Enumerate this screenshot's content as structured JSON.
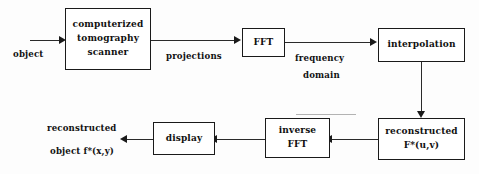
{
  "diagram": {
    "background_color": "#fdfdfd",
    "line_color": "#1a1a1a",
    "text_color": "#111111",
    "nodes": [
      {
        "id": "scanner",
        "lines": [
          "computerized",
          "tomography",
          "scanner"
        ]
      },
      {
        "id": "fft",
        "lines": [
          "FFT"
        ]
      },
      {
        "id": "interpolation",
        "lines": [
          "interpolation"
        ]
      },
      {
        "id": "reconstructed",
        "lines": [
          "reconstructed",
          "F*(u,v)"
        ]
      },
      {
        "id": "inverse_fft",
        "lines": [
          "inverse",
          "FFT"
        ]
      },
      {
        "id": "display",
        "lines": [
          "display"
        ]
      }
    ],
    "edge_labels": {
      "input": "object",
      "projections": "projections",
      "frequency": "frequency",
      "domain": "domain",
      "output_line1": "reconstructed",
      "output_line2": "object f*(x,y)"
    }
  }
}
